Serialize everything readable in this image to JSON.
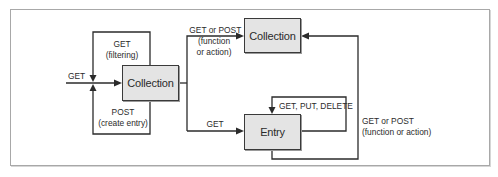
{
  "diagram": {
    "nodes": {
      "collection_main": {
        "label": "Collection"
      },
      "collection_target": {
        "label": "Collection"
      },
      "entry": {
        "label": "Entry"
      }
    },
    "edges": {
      "incoming_get": {
        "label": "GET"
      },
      "filtering": {
        "line1": "GET",
        "line2": "(filtering)"
      },
      "create_entry": {
        "line1": "POST",
        "line2": "(create entry)"
      },
      "collection_function": {
        "line1": "GET or POST",
        "line2": "(function",
        "line3": "or action)"
      },
      "collection_to_entry": {
        "label": "GET"
      },
      "entry_self": {
        "label": "GET, PUT, DELETE"
      },
      "entry_function": {
        "line1": "GET or POST",
        "line2": "(function or action)"
      }
    }
  },
  "colors": {
    "box_fill": "#e4e4e4",
    "line": "#2b2b2b",
    "frame_border": "#a8a8a8"
  }
}
